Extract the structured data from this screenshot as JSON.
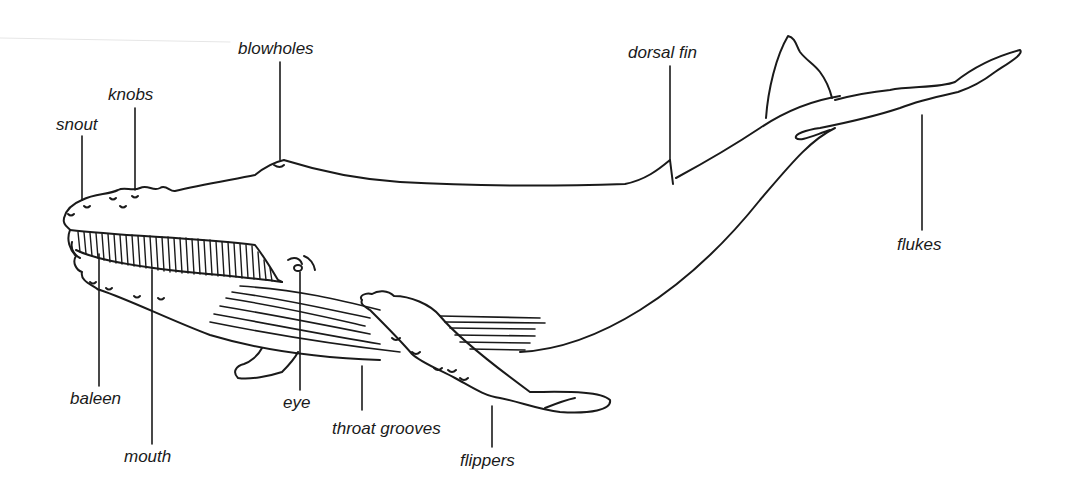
{
  "diagram": {
    "colors": {
      "ink": "#1a1a1a",
      "background": "#ffffff"
    },
    "labels": [
      {
        "id": "snout",
        "text": "snout"
      },
      {
        "id": "knobs",
        "text": "knobs"
      },
      {
        "id": "blowholes",
        "text": "blowholes"
      },
      {
        "id": "dorsal_fin",
        "text": "dorsal fin"
      },
      {
        "id": "flukes",
        "text": "flukes"
      },
      {
        "id": "baleen",
        "text": "baleen"
      },
      {
        "id": "mouth",
        "text": "mouth"
      },
      {
        "id": "eye",
        "text": "eye"
      },
      {
        "id": "throat_grooves",
        "text": "throat grooves"
      },
      {
        "id": "flippers",
        "text": "flippers"
      }
    ]
  }
}
